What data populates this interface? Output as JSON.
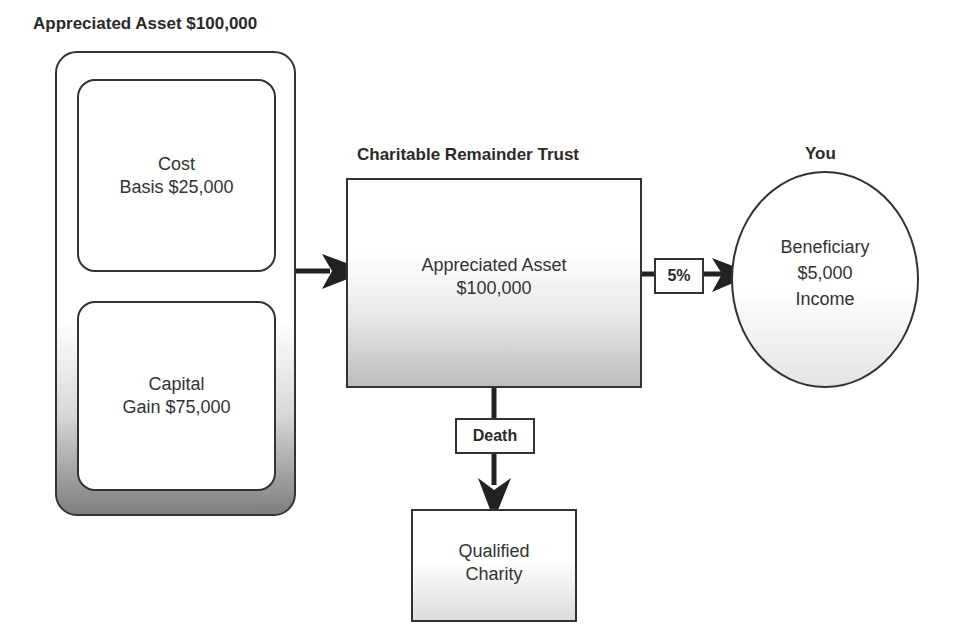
{
  "asset_group": {
    "title": "Appreciated Asset $100,000",
    "cost_basis": {
      "line1": "Cost",
      "line2": "Basis $25,000"
    },
    "capital_gain": {
      "line1": "Capital",
      "line2": "Gain $75,000"
    }
  },
  "trust": {
    "title": "Charitable Remainder Trust",
    "line1": "Appreciated Asset",
    "line2": "$100,000"
  },
  "beneficiary": {
    "title": "You",
    "line1": "Beneficiary",
    "line2": "$5,000",
    "line3": "Income"
  },
  "connectors": {
    "income_rate": "5%",
    "death_label": "Death"
  },
  "charity": {
    "line1": "Qualified",
    "line2": "Charity"
  },
  "colors": {
    "stroke": "#333333",
    "arrow": "#222222",
    "gradient_dark": "#7e7e7e"
  }
}
